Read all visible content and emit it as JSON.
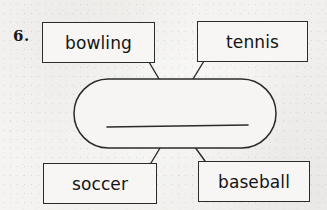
{
  "worksheet": {
    "item_number": "6.",
    "background_color": "#f3f2f0",
    "ink_color": "#2b2b2b",
    "center_answer_blank": "",
    "boxes": [
      {
        "id": "top-left",
        "label": "bowling"
      },
      {
        "id": "top-right",
        "label": "tennis"
      },
      {
        "id": "bottom-left",
        "label": "soccer"
      },
      {
        "id": "bottom-right",
        "label": "baseball"
      }
    ],
    "center_shape": {
      "name": "category-oval",
      "shape": "stadium",
      "contains": "answer-line"
    },
    "connectors": [
      {
        "from": "top-left",
        "to": "category-oval"
      },
      {
        "from": "top-right",
        "to": "category-oval"
      },
      {
        "from": "bottom-left",
        "to": "category-oval"
      },
      {
        "from": "bottom-right",
        "to": "category-oval"
      }
    ]
  }
}
